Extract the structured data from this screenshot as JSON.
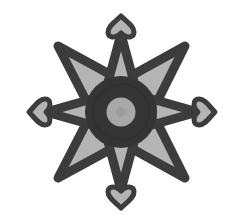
{
  "image": {
    "subject": "eight-pointed star compass rose with heart-shaped cardinal terminals",
    "width": 236,
    "height": 224,
    "background": "#ffffff"
  },
  "colors": {
    "outline": "#3c3c3c",
    "fill_light": "#b4b4b4",
    "center_ring": "#353535",
    "center_disc": "#a8a8a8",
    "center_disc_core": "#9c9c9c"
  },
  "shape": {
    "center": [
      121,
      112
    ],
    "diagonal_points": [
      "top-left",
      "top-right",
      "bottom-left",
      "bottom-right"
    ],
    "cardinal_points": [
      "north",
      "south",
      "west",
      "east"
    ],
    "cardinal_terminal": "heart"
  }
}
